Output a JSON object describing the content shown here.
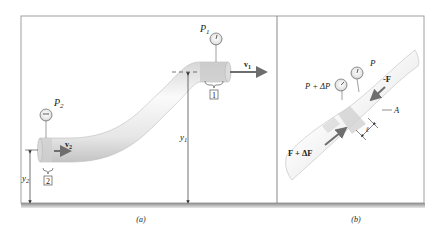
{
  "figure": {
    "panel_a": {
      "caption": "(a)",
      "labels": {
        "p1": "P",
        "p1_sub": "1",
        "p2": "P",
        "p2_sub": "2",
        "v1": "v",
        "v1_sub": "1",
        "v2": "v",
        "v2_sub": "2",
        "y1": "y",
        "y1_sub": "1",
        "y2": "y",
        "y2_sub": "2",
        "section1": "1",
        "section2": "2"
      }
    },
    "panel_b": {
      "caption": "(b)",
      "labels": {
        "p": "P",
        "p_plus": "P + ΔP",
        "neg_f": "-F",
        "f_plus": "F + ΔF",
        "area": "A",
        "length": "ℓ"
      }
    },
    "colors": {
      "pipe_light": "#f4f4f4",
      "pipe_dark": "#c9c9c9",
      "arrow": "#6e6e6e",
      "frame": "#8a8a8a",
      "shadow": "#9a9a9a"
    }
  }
}
